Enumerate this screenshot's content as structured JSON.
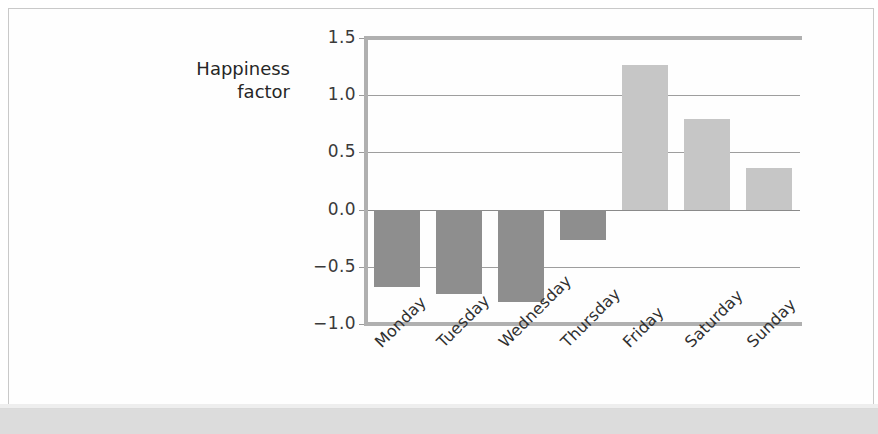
{
  "figure": {
    "background_color": "#ffffff",
    "frame_color": "#c9c9c9",
    "scan_band_color": "#d6d6d6"
  },
  "axis_title": {
    "line1": "Happiness",
    "line2": "factor"
  },
  "chart_data": {
    "type": "bar",
    "title": "",
    "xlabel": "",
    "ylabel": "Happiness factor",
    "categories": [
      "Monday",
      "Tuesday",
      "Wednesday",
      "Thursday",
      "Friday",
      "Saturday",
      "Sunday"
    ],
    "values": [
      -0.68,
      -0.74,
      -0.81,
      -0.27,
      1.26,
      0.79,
      0.36
    ],
    "ylim": [
      -1.0,
      1.5
    ],
    "yticks": [
      "1.5",
      "1.0",
      "0.5",
      "0.0",
      "-0.5",
      "-1.0"
    ],
    "ytick_values": [
      1.5,
      1.0,
      0.5,
      0.0,
      -0.5,
      -1.0
    ],
    "grid": true,
    "grid_axis": "y",
    "legend": null,
    "bar_colors": {
      "positive": "#c6c6c6",
      "negative": "#8e8e8e"
    },
    "xtick_rotation": -45
  }
}
